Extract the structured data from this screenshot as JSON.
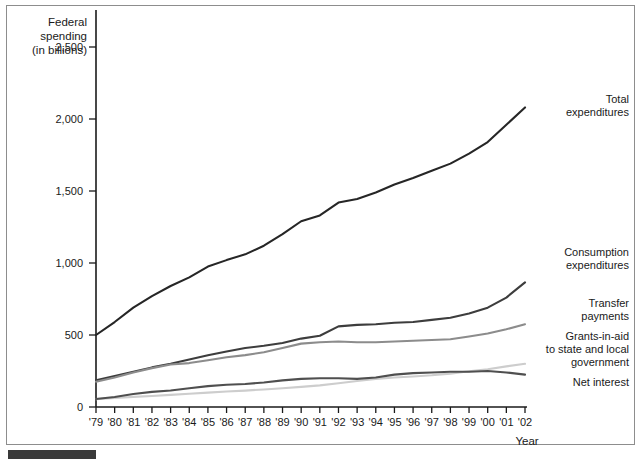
{
  "figure": {
    "y_axis_title_lines": [
      "Federal",
      "spending",
      "(in billions)"
    ],
    "x_axis_title": "Year"
  },
  "chart_data": {
    "type": "line",
    "title": "",
    "subtitle": "",
    "xlabel": "Year",
    "ylabel": "Federal spending (in billions)",
    "grid": false,
    "legend_position": "right-inline-labels",
    "ylim": [
      0,
      2750
    ],
    "yticks": [
      0,
      500,
      1000,
      1500,
      2000,
      2500
    ],
    "ytick_labels": [
      "0",
      "500",
      "1,000",
      "1,500",
      "2,000",
      "2,500"
    ],
    "x": [
      1979,
      1980,
      1981,
      1982,
      1983,
      1984,
      1985,
      1986,
      1987,
      1988,
      1989,
      1990,
      1991,
      1992,
      1993,
      1994,
      1995,
      1996,
      1997,
      1998,
      1999,
      2000,
      2001,
      2002
    ],
    "xtick_labels": [
      "'79",
      "'80",
      "'81",
      "'82",
      "'83",
      "'84",
      "'85",
      "'86",
      "'87",
      "'88",
      "'89",
      "'90",
      "'91",
      "'92",
      "'93",
      "'94",
      "'95",
      "'96",
      "'97",
      "'98",
      "'99",
      "'00",
      "'01",
      "'02"
    ],
    "series": [
      {
        "name": "Total expenditures",
        "label_lines": [
          "Total",
          "expenditures"
        ],
        "color": "#262626",
        "values": [
          500,
          590,
          690,
          770,
          840,
          900,
          975,
          1020,
          1060,
          1120,
          1200,
          1290,
          1330,
          1420,
          1445,
          1490,
          1545,
          1590,
          1640,
          1690,
          1760,
          1840,
          1960,
          2080
        ]
      },
      {
        "name": "Consumption expenditures",
        "label_lines": [
          "Consumption",
          "expenditures"
        ],
        "color": "#3d3d3d",
        "values": [
          185,
          215,
          245,
          275,
          300,
          330,
          360,
          385,
          410,
          425,
          445,
          475,
          495,
          560,
          570,
          575,
          585,
          590,
          605,
          620,
          650,
          690,
          760,
          865
        ]
      },
      {
        "name": "Transfer payments",
        "label_lines": [
          "Transfer",
          "payments"
        ],
        "color": "#8c8c8c",
        "values": [
          175,
          205,
          240,
          270,
          295,
          305,
          325,
          345,
          360,
          380,
          410,
          440,
          450,
          455,
          450,
          450,
          455,
          460,
          465,
          470,
          490,
          510,
          540,
          575
        ]
      },
      {
        "name": "Grants-in-aid to state and local government",
        "label_lines": [
          "Grants-in-aid",
          "to state and local",
          "government"
        ],
        "color": "#cdcdcd",
        "values": [
          55,
          62,
          70,
          76,
          84,
          92,
          100,
          108,
          114,
          122,
          130,
          140,
          150,
          165,
          180,
          195,
          205,
          212,
          220,
          232,
          248,
          262,
          282,
          300
        ]
      },
      {
        "name": "Net interest",
        "label_lines": [
          "Net interest"
        ],
        "color": "#4f4f4f",
        "values": [
          55,
          70,
          90,
          105,
          115,
          130,
          145,
          155,
          160,
          170,
          185,
          195,
          200,
          200,
          195,
          205,
          225,
          235,
          240,
          245,
          245,
          250,
          240,
          225
        ]
      }
    ]
  }
}
